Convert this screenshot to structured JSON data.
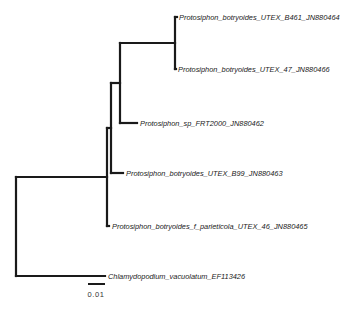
{
  "figure": {
    "type": "phylogenetic-tree",
    "line_color": "#1a1a1a",
    "background": "#ffffff"
  },
  "taxa": [
    {
      "id": "t1",
      "label": "Protosiphon_botryoides_UTEX_B461_JN880464",
      "x": 179,
      "y": 17
    },
    {
      "id": "t2",
      "label": "Protosiphon_botryoides_UTEX_47_JN880466",
      "x": 178,
      "y": 69
    },
    {
      "id": "t3",
      "label": "Protosiphon_sp_FRT2000_JN880462",
      "x": 140,
      "y": 123
    },
    {
      "id": "t4",
      "label": "Protosiphon_botryoides_UTEX_B99_JN880463",
      "x": 126,
      "y": 173
    },
    {
      "id": "t5",
      "label": "Protosiphon_botryoides_f_parieticola_UTEX_46_JN880465",
      "x": 112,
      "y": 226
    },
    {
      "id": "t6",
      "label": "Chlamydopodium_vacuolatum_EF113426",
      "x": 108,
      "y": 276
    }
  ],
  "branches": [
    {
      "name": "root-vertical",
      "x1": 16,
      "y1": 177,
      "x2": 16,
      "y2": 276
    },
    {
      "name": "root-to-ingroup",
      "x1": 16,
      "y1": 177,
      "x2": 107,
      "y2": 177
    },
    {
      "name": "outgroup-chlamydopodium",
      "x1": 16,
      "y1": 276,
      "x2": 105,
      "y2": 276
    },
    {
      "name": "ingroup-vertical",
      "x1": 107,
      "y1": 128,
      "x2": 107,
      "y2": 226
    },
    {
      "name": "tip-parieticola",
      "x1": 107,
      "y1": 226,
      "x2": 109,
      "y2": 226
    },
    {
      "name": "ingroup-to-clade-b",
      "x1": 107,
      "y1": 128,
      "x2": 111,
      "y2": 128
    },
    {
      "name": "clade-b-vertical",
      "x1": 111,
      "y1": 83,
      "x2": 111,
      "y2": 173
    },
    {
      "name": "tip-b99",
      "x1": 111,
      "y1": 173,
      "x2": 123,
      "y2": 173
    },
    {
      "name": "clade-b-to-clade-c",
      "x1": 111,
      "y1": 83,
      "x2": 120,
      "y2": 83
    },
    {
      "name": "clade-c-vertical",
      "x1": 120,
      "y1": 43,
      "x2": 120,
      "y2": 123
    },
    {
      "name": "tip-frt2000",
      "x1": 120,
      "y1": 123,
      "x2": 137,
      "y2": 123
    },
    {
      "name": "clade-c-to-clade-d",
      "x1": 120,
      "y1": 43,
      "x2": 175,
      "y2": 43
    },
    {
      "name": "clade-d-vertical",
      "x1": 175,
      "y1": 17,
      "x2": 175,
      "y2": 69
    },
    {
      "name": "tip-b461",
      "x1": 175,
      "y1": 17,
      "x2": 177,
      "y2": 17
    },
    {
      "name": "tip-utex47",
      "x1": 175,
      "y1": 69,
      "x2": 176,
      "y2": 69
    }
  ],
  "scale_bar": {
    "label": "0.01",
    "x1": 88,
    "x2": 105,
    "y": 284,
    "label_x": 96,
    "label_y": 297
  }
}
